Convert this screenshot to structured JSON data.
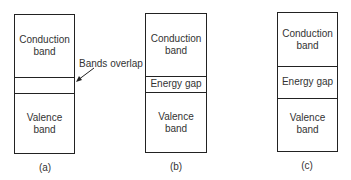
{
  "diagrams": [
    {
      "id": "a",
      "caption": "(a)",
      "conduction_label_1": "Conduction",
      "conduction_label_2": "band",
      "middle_label": "",
      "valence_label_1": "Valence",
      "valence_label_2": "band"
    },
    {
      "id": "b",
      "caption": "(b)",
      "conduction_label_1": "Conduction",
      "conduction_label_2": "band",
      "middle_label": "Energy gap",
      "valence_label_1": "Valence",
      "valence_label_2": "band"
    },
    {
      "id": "c",
      "caption": "(c)",
      "conduction_label_1": "Conduction",
      "conduction_label_2": "band",
      "middle_label": "Energy gap",
      "valence_label_1": "Valence",
      "valence_label_2": "band"
    }
  ],
  "annotation": {
    "text": "Bands overlap"
  }
}
